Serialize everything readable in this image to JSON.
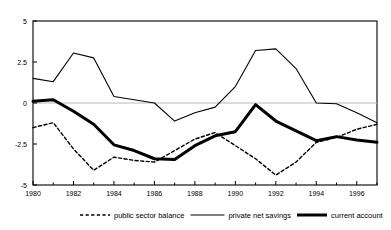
{
  "chart_data": {
    "type": "line",
    "title": "",
    "xlabel": "",
    "ylabel": "",
    "xlim": [
      1980,
      1997
    ],
    "ylim": [
      -5,
      5
    ],
    "grid": false,
    "zero_line": true,
    "legend_position": "bottom",
    "y_ticks": [
      "5",
      "2.5",
      "0",
      "-2.5",
      "-5"
    ],
    "y_tick_values": [
      5,
      2.5,
      0,
      -2.5,
      -5
    ],
    "x_ticks": [
      "1980",
      "1982",
      "1984",
      "1986",
      "1988",
      "1990",
      "1992",
      "1994",
      "1996"
    ],
    "x_tick_values": [
      1980,
      1982,
      1984,
      1986,
      1988,
      1990,
      1992,
      1994,
      1996
    ],
    "x_minor_values": [
      1981,
      1983,
      1985,
      1987,
      1989,
      1991,
      1993,
      1995,
      1997
    ],
    "x": [
      1980,
      1981,
      1982,
      1983,
      1984,
      1985,
      1986,
      1987,
      1988,
      1989,
      1990,
      1991,
      1992,
      1993,
      1994,
      1995,
      1996,
      1997
    ],
    "series": [
      {
        "name": "public sector balance",
        "style": "dashed",
        "width": 1.4,
        "color": "#000000",
        "values": [
          -1.5,
          -1.2,
          -2.8,
          -4.1,
          -3.3,
          -3.5,
          -3.6,
          -2.9,
          -2.2,
          -1.8,
          -2.6,
          -3.4,
          -4.4,
          -3.6,
          -2.4,
          -2.1,
          -1.6,
          -1.3
        ]
      },
      {
        "name": "private net savings",
        "style": "solid",
        "width": 1.1,
        "color": "#000000",
        "values": [
          1.5,
          1.3,
          3.05,
          2.75,
          0.4,
          0.2,
          0.0,
          -1.1,
          -0.6,
          -0.25,
          1.0,
          3.2,
          3.3,
          2.1,
          0.0,
          -0.05,
          -0.6,
          -1.2
        ]
      },
      {
        "name": "current account",
        "style": "thick",
        "width": 3.0,
        "color": "#000000",
        "values": [
          0.1,
          0.2,
          -0.5,
          -1.3,
          -2.55,
          -2.9,
          -3.4,
          -3.45,
          -2.6,
          -2.0,
          -1.75,
          -0.1,
          -1.1,
          -1.7,
          -2.3,
          -2.05,
          -2.25,
          -2.4
        ]
      }
    ],
    "legend": [
      {
        "label": "public sector balance",
        "style": "dashed"
      },
      {
        "label": "private net savings",
        "style": "solid"
      },
      {
        "label": "current account",
        "style": "thick"
      }
    ]
  }
}
